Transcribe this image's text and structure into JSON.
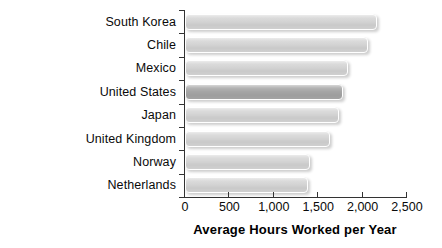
{
  "chart_data": {
    "type": "bar",
    "orientation": "horizontal",
    "title": "",
    "xlabel": "Average Hours Worked per Year",
    "ylabel": "",
    "xlim": [
      0,
      2500
    ],
    "xticks": [
      0,
      500,
      1000,
      1500,
      2000,
      2500
    ],
    "xtick_labels": [
      "0",
      "500",
      "1,000",
      "1,500",
      "2,000",
      "2,500"
    ],
    "grid": false,
    "legend": false,
    "categories": [
      "South Korea",
      "Chile",
      "Mexico",
      "United States",
      "Japan",
      "United Kingdom",
      "Norway",
      "Netherlands"
    ],
    "values": [
      2160,
      2060,
      1835,
      1780,
      1735,
      1635,
      1410,
      1385
    ],
    "highlighted_category": "United States",
    "colors": {
      "bar": "#d4d4d4",
      "bar_highlight": "#a6a6a6",
      "bar_outline": "#ffffff",
      "axis": "#333333",
      "text": "#0a0a0a"
    }
  }
}
